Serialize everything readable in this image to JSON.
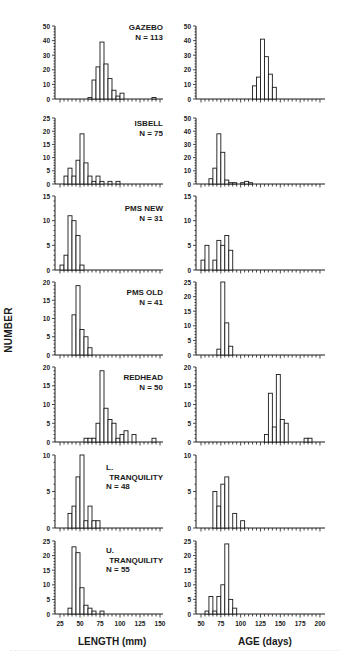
{
  "figure": {
    "ylabel": "NUMBER",
    "xlabel_left": "LENGTH (mm)",
    "xlabel_right": "AGE (days)",
    "length_ticks": [
      25,
      50,
      75,
      100,
      125,
      150
    ],
    "age_ticks": [
      50,
      75,
      100,
      125,
      150,
      175,
      200
    ]
  },
  "chart_data": [
    {
      "type": "bar",
      "panel": "GAZEBO",
      "n_label": "N = 113",
      "variable": "length",
      "title": "GAZEBO",
      "xlabel": "LENGTH (mm)",
      "ylabel": "NUMBER",
      "bin_width": 5,
      "ylim": [
        0,
        50
      ],
      "yticks": [
        0,
        10,
        20,
        30,
        40,
        50
      ],
      "bins": [
        [
          60,
          1
        ],
        [
          65,
          13
        ],
        [
          70,
          22
        ],
        [
          75,
          39
        ],
        [
          80,
          24
        ],
        [
          85,
          14
        ],
        [
          90,
          6
        ],
        [
          95,
          2
        ],
        [
          100,
          4
        ],
        [
          140,
          1
        ]
      ]
    },
    {
      "type": "bar",
      "panel": "GAZEBO",
      "variable": "age",
      "title": "GAZEBO",
      "xlabel": "AGE (days)",
      "ylabel": "NUMBER",
      "bin_width": 5,
      "ylim": [
        0,
        50
      ],
      "yticks": [
        0,
        10,
        20,
        30,
        40,
        50
      ],
      "bins": [
        [
          115,
          9
        ],
        [
          120,
          15
        ],
        [
          125,
          41
        ],
        [
          130,
          29
        ],
        [
          135,
          17
        ],
        [
          140,
          8
        ]
      ]
    },
    {
      "type": "bar",
      "panel": "ISBELL",
      "n_label": "N = 75",
      "variable": "length",
      "title": "ISBELL",
      "xlabel": "LENGTH (mm)",
      "ylabel": "NUMBER",
      "bin_width": 5,
      "ylim": [
        0,
        25
      ],
      "yticks": [
        0,
        5,
        10,
        15,
        20,
        25
      ],
      "bins": [
        [
          30,
          3
        ],
        [
          35,
          6
        ],
        [
          40,
          3
        ],
        [
          45,
          9
        ],
        [
          50,
          19
        ],
        [
          55,
          8
        ],
        [
          60,
          3
        ],
        [
          65,
          1
        ],
        [
          70,
          3
        ],
        [
          75,
          1
        ],
        [
          85,
          1
        ],
        [
          95,
          1
        ]
      ]
    },
    {
      "type": "bar",
      "panel": "ISBELL",
      "variable": "age",
      "title": "ISBELL",
      "xlabel": "AGE (days)",
      "ylabel": "NUMBER",
      "bin_width": 5,
      "ylim": [
        0,
        50
      ],
      "yticks": [
        0,
        10,
        20,
        30,
        40,
        50
      ],
      "bins": [
        [
          60,
          4
        ],
        [
          65,
          12
        ],
        [
          70,
          38
        ],
        [
          75,
          24
        ],
        [
          80,
          3
        ],
        [
          85,
          1
        ],
        [
          90,
          1
        ],
        [
          100,
          1
        ],
        [
          105,
          2
        ],
        [
          110,
          1
        ]
      ]
    },
    {
      "type": "bar",
      "panel": "PMS NEW",
      "n_label": "N = 31",
      "variable": "length",
      "title": "PMS NEW",
      "xlabel": "LENGTH (mm)",
      "ylabel": "NUMBER",
      "bin_width": 5,
      "ylim": [
        0,
        15
      ],
      "yticks": [
        0,
        5,
        10,
        15
      ],
      "bins": [
        [
          25,
          1
        ],
        [
          30,
          3
        ],
        [
          35,
          11
        ],
        [
          40,
          10
        ],
        [
          45,
          7
        ],
        [
          50,
          1
        ]
      ]
    },
    {
      "type": "bar",
      "panel": "PMS NEW",
      "variable": "age",
      "title": "PMS NEW",
      "xlabel": "AGE (days)",
      "ylabel": "NUMBER",
      "bin_width": 5,
      "ylim": [
        0,
        15
      ],
      "yticks": [
        0,
        5,
        10,
        15
      ],
      "bins": [
        [
          50,
          2
        ],
        [
          55,
          5
        ],
        [
          65,
          2
        ],
        [
          70,
          6
        ],
        [
          75,
          5
        ],
        [
          80,
          7
        ],
        [
          85,
          4
        ]
      ]
    },
    {
      "type": "bar",
      "panel": "PMS OLD",
      "n_label": "N = 41",
      "variable": "length",
      "title": "PMS OLD",
      "xlabel": "LENGTH (mm)",
      "ylabel": "NUMBER",
      "bin_width": 5,
      "ylim": [
        0,
        20
      ],
      "yticks": [
        0,
        5,
        10,
        15,
        20
      ],
      "bins": [
        [
          40,
          11
        ],
        [
          45,
          19
        ],
        [
          50,
          7
        ],
        [
          55,
          5
        ],
        [
          60,
          2
        ]
      ]
    },
    {
      "type": "bar",
      "panel": "PMS OLD",
      "variable": "age",
      "title": "PMS OLD",
      "xlabel": "AGE (days)",
      "ylabel": "NUMBER",
      "bin_width": 5,
      "ylim": [
        0,
        25
      ],
      "yticks": [
        0,
        5,
        10,
        15,
        20,
        25
      ],
      "bins": [
        [
          70,
          2
        ],
        [
          75,
          25
        ],
        [
          80,
          11
        ],
        [
          85,
          3
        ]
      ]
    },
    {
      "type": "bar",
      "panel": "REDHEAD",
      "n_label": "N = 50",
      "variable": "length",
      "title": "REDHEAD",
      "xlabel": "LENGTH (mm)",
      "ylabel": "NUMBER",
      "bin_width": 5,
      "ylim": [
        0,
        20
      ],
      "yticks": [
        0,
        5,
        10,
        15,
        20
      ],
      "bins": [
        [
          55,
          1
        ],
        [
          60,
          1
        ],
        [
          65,
          1
        ],
        [
          70,
          5
        ],
        [
          75,
          19
        ],
        [
          80,
          9
        ],
        [
          85,
          6
        ],
        [
          90,
          5
        ],
        [
          95,
          1
        ],
        [
          100,
          2
        ],
        [
          105,
          3
        ],
        [
          115,
          2
        ],
        [
          140,
          1
        ]
      ]
    },
    {
      "type": "bar",
      "panel": "REDHEAD",
      "variable": "age",
      "title": "REDHEAD",
      "xlabel": "AGE (days)",
      "ylabel": "NUMBER",
      "bin_width": 5,
      "ylim": [
        0,
        20
      ],
      "yticks": [
        0,
        5,
        10,
        15,
        20
      ],
      "bins": [
        [
          130,
          2
        ],
        [
          135,
          13
        ],
        [
          140,
          4
        ],
        [
          145,
          18
        ],
        [
          150,
          6
        ],
        [
          155,
          5
        ],
        [
          180,
          1
        ],
        [
          185,
          1
        ]
      ]
    },
    {
      "type": "bar",
      "panel": "L. TRANQUILITY",
      "n_label": "N = 48",
      "variable": "length",
      "title": "L. TRANQUILITY",
      "xlabel": "LENGTH (mm)",
      "ylabel": "NUMBER",
      "bin_width": 5,
      "ylim": [
        0,
        10
      ],
      "yticks": [
        0,
        5,
        10
      ],
      "bins": [
        [
          35,
          2
        ],
        [
          40,
          3
        ],
        [
          45,
          7
        ],
        [
          50,
          10
        ],
        [
          55,
          1
        ],
        [
          60,
          3
        ],
        [
          65,
          1
        ],
        [
          70,
          1
        ]
      ]
    },
    {
      "type": "bar",
      "panel": "L. TRANQUILITY",
      "variable": "age",
      "title": "L. TRANQUILITY",
      "xlabel": "AGE (days)",
      "ylabel": "NUMBER",
      "bin_width": 5,
      "ylim": [
        0,
        10
      ],
      "yticks": [
        0,
        5,
        10
      ],
      "bins": [
        [
          65,
          5
        ],
        [
          70,
          3
        ],
        [
          75,
          6
        ],
        [
          80,
          7
        ],
        [
          90,
          2
        ],
        [
          100,
          1
        ]
      ]
    },
    {
      "type": "bar",
      "panel": "U. TRANQUILITY",
      "n_label": "N = 55",
      "variable": "length",
      "title": "U. TRANQUILITY",
      "xlabel": "LENGTH (mm)",
      "ylabel": "NUMBER",
      "bin_width": 5,
      "ylim": [
        0,
        25
      ],
      "yticks": [
        0,
        5,
        10,
        15,
        20,
        25
      ],
      "bins": [
        [
          35,
          2
        ],
        [
          40,
          23
        ],
        [
          45,
          21
        ],
        [
          50,
          9
        ],
        [
          55,
          3
        ],
        [
          60,
          2
        ],
        [
          65,
          1
        ],
        [
          75,
          1
        ]
      ]
    },
    {
      "type": "bar",
      "panel": "U. TRANQUILITY",
      "variable": "age",
      "title": "U. TRANQUILITY",
      "xlabel": "AGE (days)",
      "ylabel": "NUMBER",
      "bin_width": 5,
      "ylim": [
        0,
        25
      ],
      "yticks": [
        0,
        5,
        10,
        15,
        20,
        25
      ],
      "bins": [
        [
          55,
          1
        ],
        [
          60,
          6
        ],
        [
          65,
          1
        ],
        [
          70,
          6
        ],
        [
          75,
          10
        ],
        [
          80,
          24
        ],
        [
          85,
          5
        ],
        [
          90,
          2
        ]
      ]
    }
  ],
  "layout": {
    "left": {
      "axis_x": 55,
      "x_end": 163,
      "xmin": 25,
      "px_per_unit": 0.8,
      "minor_step": 5
    },
    "right": {
      "axis_x": 196,
      "x_end": 325,
      "xmin": 50,
      "px_per_unit": 0.793,
      "minor_step": 5
    },
    "rows": [
      {
        "top": 26,
        "base": 99,
        "label_lines": [
          "GAZEBO",
          "N = 113"
        ],
        "label_top": 22
      },
      {
        "top": 118,
        "base": 184,
        "label_lines": [
          "ISBELL",
          "N = 75"
        ],
        "label_top": 118
      },
      {
        "top": 196,
        "base": 270,
        "label_lines": [
          "PMS NEW",
          "N = 31"
        ],
        "label_top": 203
      },
      {
        "top": 282,
        "base": 355,
        "label_lines": [
          "PMS OLD",
          "N = 41"
        ],
        "label_top": 287
      },
      {
        "top": 367,
        "base": 442,
        "label_lines": [
          "REDHEAD",
          "N = 50"
        ],
        "label_top": 372
      },
      {
        "top": 455,
        "base": 528,
        "label_lines": [
          "L.",
          "TRANQUILITY",
          "N = 48"
        ],
        "label_top": 462
      },
      {
        "top": 541,
        "base": 614,
        "label_lines": [
          "U.",
          "TRANQUILITY",
          "N = 55"
        ],
        "label_top": 545
      }
    ]
  }
}
